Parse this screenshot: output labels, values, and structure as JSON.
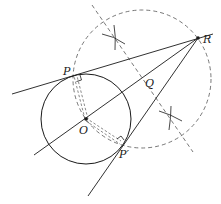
{
  "diagram": {
    "labels": {
      "R": "R",
      "P": "P",
      "Q": "Q",
      "O": "O",
      "P_prime": "P′"
    },
    "colors": {
      "stroke": "#1a1a1a",
      "dashed": "#555555",
      "background": "#ffffff"
    }
  }
}
